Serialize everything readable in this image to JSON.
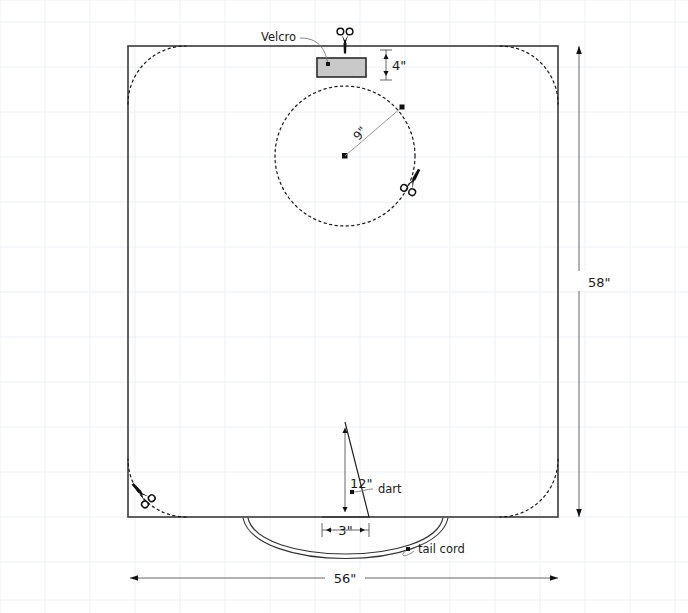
{
  "diagram": {
    "background_grid": {
      "visible": true,
      "spacing_px": 45,
      "color": "#eef0f3"
    },
    "fabric_panel": {
      "name": "main fabric rectangle",
      "width_label": "56\"",
      "height_label": "58\"",
      "corner_treatment": "rounded dashed cut lines"
    },
    "labels": {
      "velcro": "Velcro",
      "dart": "dart",
      "tail_cord": "tail cord"
    },
    "dimensions": {
      "overall_width": "56\"",
      "overall_height": "58\"",
      "velcro_offset": "4\"",
      "circle_radius": "9\"",
      "dart_height": "12\"",
      "dart_width": "3\""
    },
    "colors": {
      "outline": "#3a3a3a",
      "cut_dash": "#1c1c1c",
      "velcro_fill": "#c9c9c9",
      "velcro_stroke": "#2b2b2b",
      "dimension": "#555555",
      "leader": "#777777",
      "grid": "#eef0f3"
    },
    "icons": {
      "scissors_top": "scissors-icon",
      "scissors_circle": "scissors-icon",
      "scissors_corner": "scissors-icon"
    }
  }
}
